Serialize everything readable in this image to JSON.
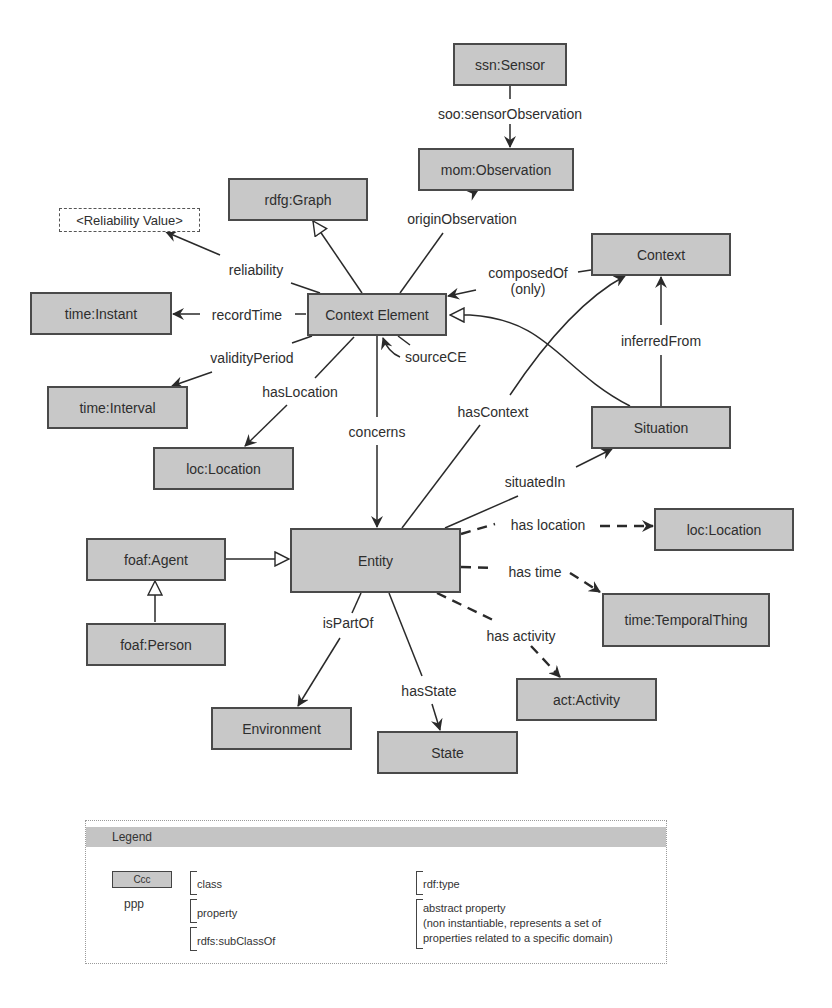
{
  "nodes": {
    "ssn_sensor": "ssn:Sensor",
    "mom_observation": "mom:Observation",
    "rdfg_graph": "rdfg:Graph",
    "reliability_value": "<Reliability Value>",
    "context": "Context",
    "context_element": "Context Element",
    "time_instant": "time:Instant",
    "time_interval": "time:Interval",
    "loc_location_left": "loc:Location",
    "situation": "Situation",
    "entity": "Entity",
    "foaf_agent": "foaf:Agent",
    "foaf_person": "foaf:Person",
    "loc_location_right": "loc:Location",
    "time_temporal_thing": "time:TemporalThing",
    "act_activity": "act:Activity",
    "environment": "Environment",
    "state": "State"
  },
  "edges": {
    "sensor_observation": "soo:sensorObservation",
    "origin_observation": "originObservation",
    "reliability": "reliability",
    "record_time": "recordTime",
    "validity_period": "validityPeriod",
    "has_location": "hasLocation",
    "source_ce": "sourceCE",
    "composed_of": "composedOf",
    "composed_of_qualifier": "(only)",
    "concerns": "concerns",
    "has_context": "hasContext",
    "inferred_from": "inferredFrom",
    "situated_in": "situatedIn",
    "has_location_abstract": "has location",
    "has_time": "has time",
    "has_activity": "has activity",
    "is_part_of": "isPartOf",
    "has_state": "hasState"
  },
  "legend": {
    "title": "Legend",
    "class_sample": "Ccc",
    "class_label": "class",
    "property_sample": "ppp",
    "property_label": "property",
    "subclass_label": "rdfs:subClassOf",
    "rdf_type_label": "rdf:type",
    "abstract_label_line1": "abstract property",
    "abstract_label_line2": "(non instantiable, represents a set of",
    "abstract_label_line3": "properties related to a specific domain)"
  },
  "colors": {
    "node_fill": "#c8c8c8",
    "node_border": "#4a4a4a",
    "edge": "#2a2a2a",
    "legend_header": "#c4c4c4"
  }
}
